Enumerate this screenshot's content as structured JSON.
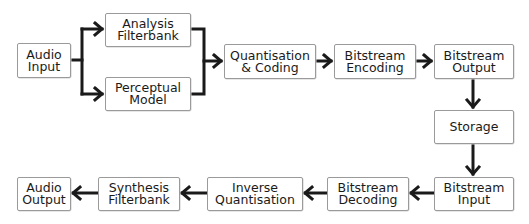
{
  "diagram": {
    "nodes": {
      "audio_input": "Audio\nInput",
      "analysis_filterbank": "Analysis\nFilterbank",
      "perceptual_model": "Perceptual\nModel",
      "quantisation_coding": "Quantisation\n& Coding",
      "bitstream_encoding": "Bitstream\nEncoding",
      "bitstream_output": "Bitstream\nOutput",
      "storage": "Storage",
      "bitstream_input": "Bitstream\nInput",
      "bitstream_decoding": "Bitstream\nDecoding",
      "inverse_quantisation": "Inverse\nQuantisation",
      "synthesis_filterbank": "Synthesis\nFilterbank",
      "audio_output": "Audio\nOutput"
    },
    "edges": [
      [
        "audio_input",
        "analysis_filterbank"
      ],
      [
        "audio_input",
        "perceptual_model"
      ],
      [
        "analysis_filterbank",
        "quantisation_coding"
      ],
      [
        "perceptual_model",
        "quantisation_coding"
      ],
      [
        "quantisation_coding",
        "bitstream_encoding"
      ],
      [
        "bitstream_encoding",
        "bitstream_output"
      ],
      [
        "bitstream_output",
        "storage"
      ],
      [
        "storage",
        "bitstream_input"
      ],
      [
        "bitstream_input",
        "bitstream_decoding"
      ],
      [
        "bitstream_decoding",
        "inverse_quantisation"
      ],
      [
        "inverse_quantisation",
        "synthesis_filterbank"
      ],
      [
        "synthesis_filterbank",
        "audio_output"
      ]
    ],
    "colors": {
      "line": "#1a1a1a",
      "border": "#9a9a9a",
      "text": "#1a1a1a"
    }
  }
}
